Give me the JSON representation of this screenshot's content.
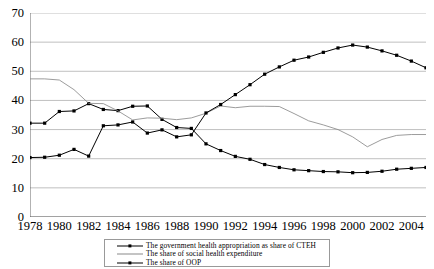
{
  "chart_data": {
    "type": "line",
    "title": "",
    "xlabel": "",
    "ylabel": "",
    "ylim": [
      0,
      70
    ],
    "ytick_step": 10,
    "yticks": [
      0,
      10,
      20,
      30,
      40,
      50,
      60,
      70
    ],
    "xlim": [
      1978,
      2005
    ],
    "x": [
      1978,
      1979,
      1980,
      1981,
      1982,
      1983,
      1984,
      1985,
      1986,
      1987,
      1988,
      1989,
      1990,
      1991,
      1992,
      1993,
      1994,
      1995,
      1996,
      1997,
      1998,
      1999,
      2000,
      2001,
      2002,
      2003,
      2004,
      2005
    ],
    "xtick_labels": [
      "1978",
      "1980",
      "1982",
      "1984",
      "1986",
      "1988",
      "1990",
      "1992",
      "1994",
      "1996",
      "1998",
      "2000",
      "2002",
      "2004"
    ],
    "xtick_values": [
      1978,
      1980,
      1982,
      1984,
      1986,
      1988,
      1990,
      1992,
      1994,
      1996,
      1998,
      2000,
      2002,
      2004
    ],
    "grid": true,
    "grid_axis": "y",
    "legend_position": "bottom",
    "series": [
      {
        "name": "The government health appropriation as share of CTEH",
        "marker": "square",
        "color": "#000000",
        "values": [
          32.2,
          32.2,
          36.2,
          36.4,
          38.9,
          36.9,
          36.5,
          38.0,
          38.1,
          33.5,
          30.7,
          30.4,
          25.1,
          22.8,
          20.8,
          19.8,
          18.0,
          17.0,
          16.2,
          15.9,
          15.6,
          15.5,
          15.2,
          15.3,
          15.7,
          16.4,
          16.7,
          17.0
        ]
      },
      {
        "name": "The share of social health expenditure",
        "marker": "none",
        "color": "#8a8a8a",
        "values": [
          47.4,
          47.4,
          47.0,
          43.7,
          39.0,
          38.9,
          36.4,
          33.3,
          34.0,
          33.9,
          33.4,
          34.0,
          35.6,
          38.1,
          37.5,
          38.0,
          38.0,
          37.9,
          35.5,
          33.0,
          31.6,
          30.0,
          27.5,
          24.1,
          26.6,
          28.0,
          28.3,
          28.3
        ]
      },
      {
        "name": "The share of OOP",
        "marker": "square",
        "color": "#000000",
        "values": [
          20.4,
          20.5,
          21.2,
          23.2,
          20.9,
          31.3,
          31.6,
          32.6,
          28.8,
          29.9,
          27.5,
          28.2,
          35.7,
          38.6,
          42.0,
          45.4,
          49.0,
          51.5,
          53.8,
          54.9,
          56.5,
          58.0,
          59.0,
          58.3,
          57.0,
          55.5,
          53.5,
          51.2
        ]
      }
    ]
  },
  "legend": {
    "items": [
      {
        "label": "The government health appropriation as share of CTEH",
        "key": "line-marker-key",
        "style": "marker"
      },
      {
        "label": "The share of social health expenditure",
        "key": "line-key",
        "style": "thin"
      },
      {
        "label": "The share of OOP",
        "key": "line-marker-key",
        "style": "marker"
      }
    ]
  }
}
